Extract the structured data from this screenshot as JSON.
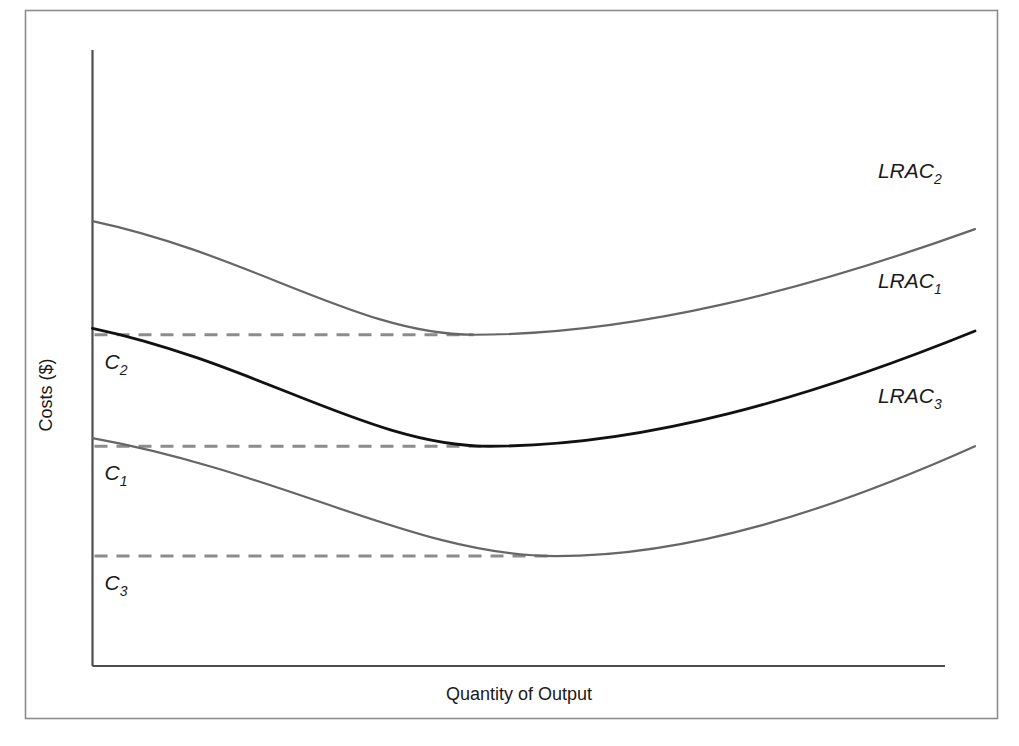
{
  "figure": {
    "background_color": "#ffffff",
    "frame_color": "#8c8c8c",
    "axis_color": "#4d4d4d",
    "dash_color": "#8c8c8c"
  },
  "chart_data": {
    "type": "line",
    "title": "",
    "xlabel": "Quantity of Output",
    "ylabel": "Costs ($)",
    "xlim": [
      0,
      100
    ],
    "ylim": [
      0,
      100
    ],
    "grid": false,
    "axis_ticks": false,
    "legend": "inline-right-labels",
    "series": [
      {
        "name": "LRAC2",
        "label": "LRAC",
        "subscript": "2",
        "color": "#666666",
        "width": 2.2,
        "minimum_cost_label": "C2",
        "start": {
          "x": 0.0,
          "y": 83.0
        },
        "minimum": {
          "x": 43.2,
          "y": 61.8
        },
        "end": {
          "x": 100.0,
          "y": 81.5
        },
        "label_pos": {
          "x": 89.0,
          "y": 91.0
        }
      },
      {
        "name": "LRAC1",
        "label": "LRAC",
        "subscript": "1",
        "color": "#111111",
        "width": 2.8,
        "minimum_cost_label": "C1",
        "start": {
          "x": 0.0,
          "y": 63.0
        },
        "minimum": {
          "x": 45.0,
          "y": 41.0
        },
        "end": {
          "x": 100.0,
          "y": 62.5
        },
        "label_pos": {
          "x": 89.0,
          "y": 70.5
        }
      },
      {
        "name": "LRAC3",
        "label": "LRAC",
        "subscript": "3",
        "color": "#666666",
        "width": 2.2,
        "minimum_cost_label": "C3",
        "start": {
          "x": 0.0,
          "y": 42.5
        },
        "minimum": {
          "x": 52.5,
          "y": 20.5
        },
        "end": {
          "x": 100.0,
          "y": 41.0
        },
        "label_pos": {
          "x": 89.0,
          "y": 49.0
        }
      }
    ],
    "cost_levels": [
      {
        "label": "C",
        "subscript": "2",
        "value": 61.8,
        "dash_to_series": "LRAC2"
      },
      {
        "label": "C",
        "subscript": "1",
        "value": 41.0,
        "dash_to_series": "LRAC1"
      },
      {
        "label": "C",
        "subscript": "3",
        "value": 20.5,
        "dash_to_series": "LRAC3"
      }
    ],
    "annotations": []
  }
}
